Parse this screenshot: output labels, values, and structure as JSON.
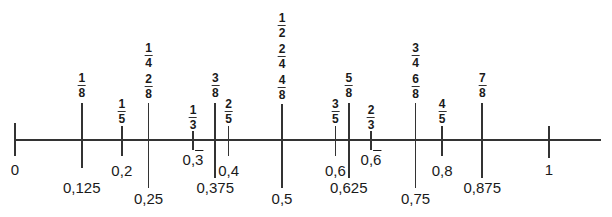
{
  "diagram": {
    "type": "number_line",
    "title": "",
    "range": [
      0,
      1
    ],
    "axis": {
      "x_start": 15,
      "x_end": 601,
      "y": 140,
      "px_per_unit": 534,
      "origin_x": 15
    },
    "endpoints": [
      {
        "value": 0,
        "label": "0"
      },
      {
        "value": 1,
        "label": "1"
      }
    ],
    "marks": [
      {
        "id": "eighth-1",
        "value": 0.125,
        "fractions": [
          {
            "n": "1",
            "d": "8"
          }
        ],
        "decimal": "0,125",
        "decimal_repeat": "",
        "tick_top": 103,
        "tick_bottom": 168,
        "frac_top": 72,
        "dec_top": 180
      },
      {
        "id": "fifth-1",
        "value": 0.2,
        "fractions": [
          {
            "n": "1",
            "d": "5"
          }
        ],
        "decimal": "0,2",
        "decimal_repeat": "",
        "tick_top": 126,
        "tick_bottom": 156,
        "frac_top": 98,
        "dec_top": 163
      },
      {
        "id": "quarter-1",
        "value": 0.25,
        "fractions": [
          {
            "n": "1",
            "d": "4"
          },
          {
            "n": "2",
            "d": "8"
          }
        ],
        "decimal": "0,25",
        "decimal_repeat": "",
        "tick_top": 103,
        "tick_bottom": 188,
        "frac_top": 42,
        "dec_top": 191
      },
      {
        "id": "third-1",
        "value": 0.3333,
        "fractions": [
          {
            "n": "1",
            "d": "3"
          }
        ],
        "decimal": "0,",
        "decimal_repeat": "3",
        "tick_top": 131,
        "tick_bottom": 150,
        "frac_top": 104,
        "dec_top": 152
      },
      {
        "id": "eighth-3",
        "value": 0.375,
        "fractions": [
          {
            "n": "3",
            "d": "8"
          }
        ],
        "decimal": "0,375",
        "decimal_repeat": "",
        "tick_top": 103,
        "tick_bottom": 178,
        "frac_top": 72,
        "dec_top": 180
      },
      {
        "id": "fifth-2",
        "value": 0.4,
        "fractions": [
          {
            "n": "2",
            "d": "5"
          }
        ],
        "decimal": "0,4",
        "decimal_repeat": "",
        "tick_top": 126,
        "tick_bottom": 156,
        "frac_top": 98,
        "dec_top": 163
      },
      {
        "id": "half",
        "value": 0.5,
        "fractions": [
          {
            "n": "1",
            "d": "2"
          },
          {
            "n": "2",
            "d": "4"
          },
          {
            "n": "4",
            "d": "8"
          }
        ],
        "decimal": "0,5",
        "decimal_repeat": "",
        "tick_top": 104,
        "tick_bottom": 188,
        "frac_top": 12,
        "dec_top": 191
      },
      {
        "id": "fifth-3",
        "value": 0.6,
        "fractions": [
          {
            "n": "3",
            "d": "5"
          }
        ],
        "decimal": "0,6",
        "decimal_repeat": "",
        "tick_top": 126,
        "tick_bottom": 156,
        "frac_top": 98,
        "dec_top": 163
      },
      {
        "id": "eighth-5",
        "value": 0.625,
        "fractions": [
          {
            "n": "5",
            "d": "8"
          }
        ],
        "decimal": "0,625",
        "decimal_repeat": "",
        "tick_top": 103,
        "tick_bottom": 178,
        "frac_top": 72,
        "dec_top": 180
      },
      {
        "id": "third-2",
        "value": 0.6667,
        "fractions": [
          {
            "n": "2",
            "d": "3"
          }
        ],
        "decimal": "0,",
        "decimal_repeat": "6",
        "tick_top": 131,
        "tick_bottom": 150,
        "frac_top": 104,
        "dec_top": 152
      },
      {
        "id": "quarter-3",
        "value": 0.75,
        "fractions": [
          {
            "n": "3",
            "d": "4"
          },
          {
            "n": "6",
            "d": "8"
          }
        ],
        "decimal": "0,75",
        "decimal_repeat": "",
        "tick_top": 103,
        "tick_bottom": 188,
        "frac_top": 42,
        "dec_top": 191
      },
      {
        "id": "fifth-4",
        "value": 0.8,
        "fractions": [
          {
            "n": "4",
            "d": "5"
          }
        ],
        "decimal": "0,8",
        "decimal_repeat": "",
        "tick_top": 126,
        "tick_bottom": 156,
        "frac_top": 98,
        "dec_top": 163
      },
      {
        "id": "eighth-7",
        "value": 0.875,
        "fractions": [
          {
            "n": "7",
            "d": "8"
          }
        ],
        "decimal": "0,875",
        "decimal_repeat": "",
        "tick_top": 103,
        "tick_bottom": 178,
        "frac_top": 72,
        "dec_top": 180
      }
    ]
  },
  "colors": {
    "line": "#333333",
    "text": "#1a1a1a",
    "background": "#ffffff"
  }
}
